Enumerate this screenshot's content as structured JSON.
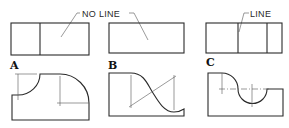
{
  "figure": {
    "callouts": {
      "no_line": "NO LINE",
      "line": "LINE"
    },
    "panels": [
      {
        "label": "A",
        "top_view": "rectangle with one dividing line",
        "front_view": "concave arc and convex arc profile"
      },
      {
        "label": "B",
        "top_view": "rectangle with no dividing line",
        "front_view": "tangent reverse (S) curve profile"
      },
      {
        "label": "C",
        "top_view": "rectangle with two dividing lines",
        "front_view": "convex arc meeting concave semicircle profile"
      }
    ],
    "colors": {
      "line": "#2a2a2a",
      "construction": "#555555",
      "background": "#ffffff"
    }
  }
}
